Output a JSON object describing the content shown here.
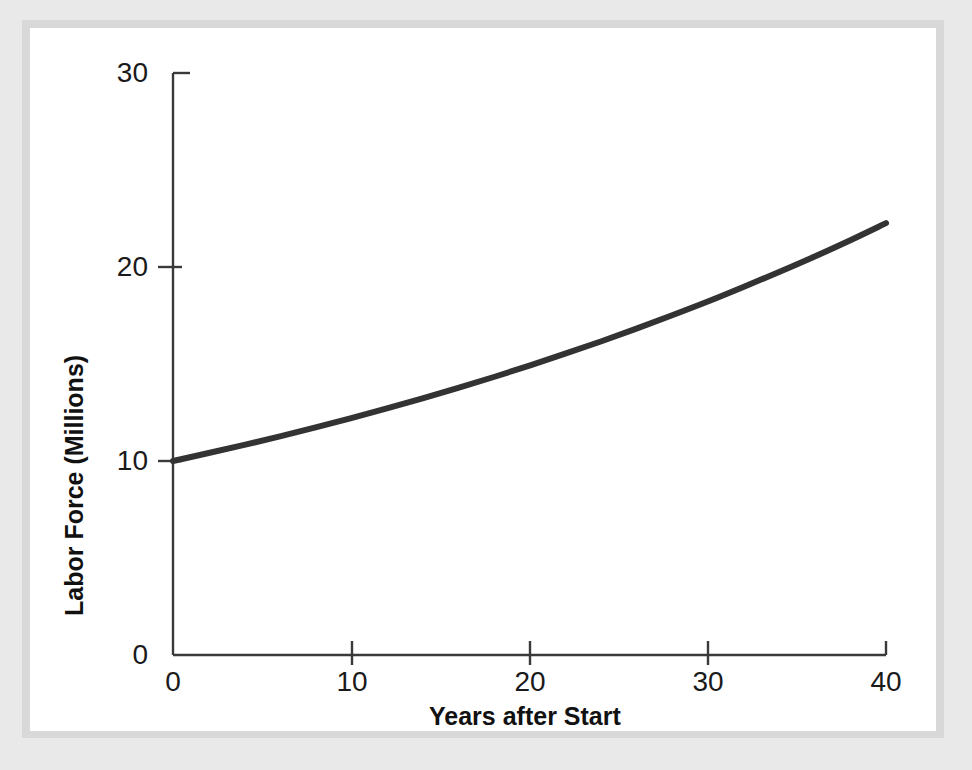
{
  "figure": {
    "background_color": "#ffffff",
    "mat_color": "#e9e9e9",
    "line_color": "#333333",
    "axis_color": "#3a3a3a"
  },
  "chart_data": {
    "type": "line",
    "title": "",
    "subtitle": "",
    "xlabel": "Years after Start",
    "ylabel": "Labor Force (Millions)",
    "xlim": [
      0,
      40
    ],
    "ylim": [
      0,
      30
    ],
    "xticks": [
      "0",
      "10",
      "20",
      "30",
      "40"
    ],
    "yticks": [
      "0",
      "10",
      "20",
      "30"
    ],
    "xtick_values": [
      0,
      10,
      20,
      30,
      40
    ],
    "ytick_values": [
      0,
      10,
      20,
      30
    ],
    "grid": false,
    "legend": null,
    "legend_position": "none",
    "annotations": [],
    "series": [
      {
        "name": "Labor Force",
        "color": "#333333",
        "x": [
          0,
          2,
          4,
          6,
          8,
          10,
          12,
          14,
          16,
          18,
          20,
          22,
          24,
          26,
          28,
          30,
          32,
          34,
          36,
          38,
          40
        ],
        "values": [
          10.0,
          10.41,
          10.83,
          11.27,
          11.73,
          12.21,
          12.71,
          13.23,
          13.77,
          14.33,
          14.92,
          15.53,
          16.16,
          16.82,
          17.51,
          18.22,
          18.97,
          19.74,
          20.54,
          21.38,
          22.26
        ]
      }
    ]
  },
  "axis_labels": {
    "y_title": "Labor Force (Millions)",
    "x_title": "Years after Start"
  }
}
